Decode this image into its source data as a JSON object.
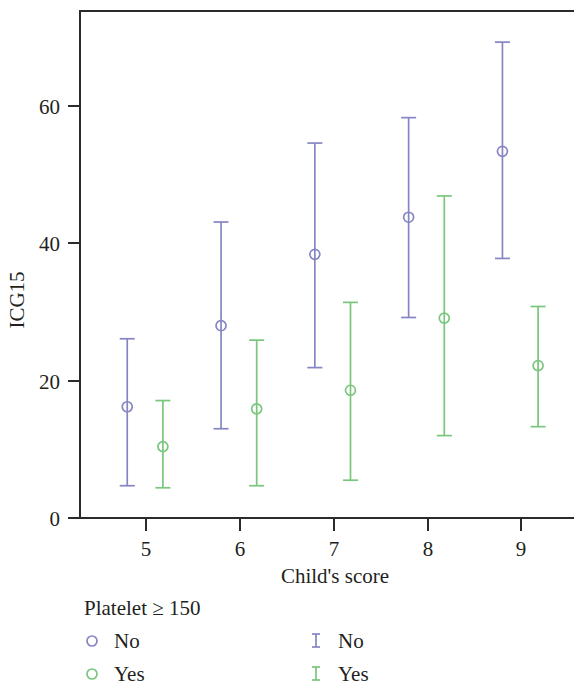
{
  "chart_data": {
    "type": "scatter",
    "title": "",
    "xlabel": "Child's score",
    "ylabel": "ICG15",
    "x": [
      5,
      6,
      7,
      8,
      9
    ],
    "xticklabels": [
      "5",
      "6",
      "7",
      "8",
      "9"
    ],
    "yticklabels": [
      "0",
      "20",
      "40",
      "60"
    ],
    "yticks": [
      0,
      20,
      40,
      60
    ],
    "xlim": [
      4.45,
      9.6
    ],
    "ylim": [
      -1.5,
      72
    ],
    "grid": false,
    "legend_position": "below-axes",
    "error_bar_style": "mean with 95% CI caps",
    "series": [
      {
        "name": "No",
        "legend_label": "No",
        "color": "#8585c4",
        "marker": "open-circle",
        "x_offset": -0.2,
        "points": [
          {
            "category": "5",
            "mean": 16.2,
            "lower": 4.7,
            "upper": 26.1
          },
          {
            "category": "6",
            "mean": 28.0,
            "lower": 13.0,
            "upper": 43.1
          },
          {
            "category": "7",
            "mean": 38.4,
            "lower": 21.9,
            "upper": 54.6
          },
          {
            "category": "8",
            "mean": 43.8,
            "lower": 29.2,
            "upper": 58.3
          },
          {
            "category": "9",
            "mean": 53.4,
            "lower": 37.8,
            "upper": 69.3
          }
        ]
      },
      {
        "name": "Yes",
        "legend_label": "Yes",
        "color": "#79c67c",
        "marker": "open-circle",
        "x_offset": 0.18,
        "points": [
          {
            "category": "5",
            "mean": 10.4,
            "lower": 4.4,
            "upper": 17.1
          },
          {
            "category": "6",
            "mean": 15.9,
            "lower": 4.7,
            "upper": 25.9
          },
          {
            "category": "7",
            "mean": 18.6,
            "lower": 5.5,
            "upper": 31.4
          },
          {
            "category": "8",
            "mean": 29.1,
            "lower": 12.0,
            "upper": 46.9
          },
          {
            "category": "9",
            "mean": 22.2,
            "lower": 13.3,
            "upper": 30.8
          }
        ]
      }
    ]
  },
  "legend": {
    "title": "Platelet ≥ 150",
    "columns": [
      {
        "glyph": "open-circle",
        "items": [
          {
            "label": "No",
            "color": "#8585c4"
          },
          {
            "label": "Yes",
            "color": "#79c67c"
          }
        ]
      },
      {
        "glyph": "i-bar",
        "items": [
          {
            "label": "No",
            "color": "#8585c4"
          },
          {
            "label": "Yes",
            "color": "#79c67c"
          }
        ]
      }
    ]
  },
  "axes": {
    "x_title": "Child's score",
    "y_title": "ICG15"
  },
  "colors": {
    "series_no": "#8585c4",
    "series_yes": "#79c67c",
    "axis": "#2b2b2b",
    "text": "#231f20",
    "background": "#ffffff"
  }
}
